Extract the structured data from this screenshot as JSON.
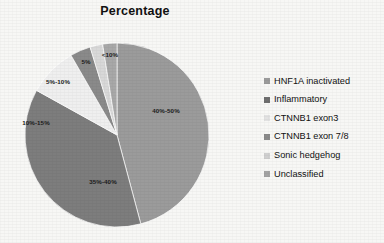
{
  "chart_data": {
    "type": "pie",
    "title": "Percentage",
    "xlabel": "",
    "ylabel": "",
    "legend_position": "right",
    "grid": false,
    "categories": [
      "HNF1A inactivated",
      "Inflammatory",
      "CTNNB1 exon3",
      "CTNNB1 exon 7/8",
      "Sonic hedgehog",
      "Unclassified"
    ],
    "data_labels": [
      "40%-50%",
      "35%-40%",
      "10%-15%",
      "5%-10%",
      "5%",
      "<10%"
    ],
    "values": [
      45,
      37.5,
      12.5,
      7.5,
      5,
      7
    ],
    "colors": [
      "#9b9b9b",
      "#7d7d7d",
      "#efefef",
      "#8a8a8a",
      "#d8d8d8",
      "#a8a8a8"
    ],
    "slices": [
      {
        "label": "40%-50%",
        "category": "HNF1A inactivated",
        "value": 45,
        "start_angle": 0,
        "sweep": 165,
        "color": "#9b9b9b",
        "label_x": 166,
        "label_y": 110
      },
      {
        "label": "35%-40%",
        "category": "Inflammatory",
        "value": 37.5,
        "start_angle": 165,
        "sweep": 134,
        "color": "#7d7d7d",
        "label_x": 103,
        "label_y": 181
      },
      {
        "label": "10%-15%",
        "category": "CTNNB1 exon3",
        "value": 12.5,
        "start_angle": 299,
        "sweep": 31,
        "color": "#efefef",
        "label_x": 36,
        "label_y": 122
      },
      {
        "label": "5%-10%",
        "category": "CTNNB1 exon 7/8",
        "value": 7.5,
        "start_angle": 330,
        "sweep": 13,
        "color": "#8a8a8a",
        "label_x": 58,
        "label_y": 81
      },
      {
        "label": "5%",
        "category": "Sonic hedgehog",
        "value": 5,
        "start_angle": 343,
        "sweep": 8,
        "color": "#d8d8d8",
        "label_x": 86,
        "label_y": 61
      },
      {
        "label": "<10%",
        "category": "Unclassified",
        "value": 7,
        "start_angle": 351,
        "sweep": 9,
        "color": "#a8a8a8",
        "label_x": 110,
        "label_y": 54
      }
    ],
    "geometry": {
      "cx": 117,
      "cy": 135,
      "r": 92
    }
  },
  "legend": {
    "items": [
      {
        "label": "HNF1A inactivated",
        "color": "#9b9b9b"
      },
      {
        "label": "Inflammatory",
        "color": "#6f6f6f"
      },
      {
        "label": "CTNNB1 exon3",
        "color": "#e2e2e2"
      },
      {
        "label": "CTNNB1 exon 7/8",
        "color": "#8a8a8a"
      },
      {
        "label": "Sonic hedgehog",
        "color": "#cfcfcf"
      },
      {
        "label": "Unclassified",
        "color": "#a4a4a4"
      }
    ]
  }
}
